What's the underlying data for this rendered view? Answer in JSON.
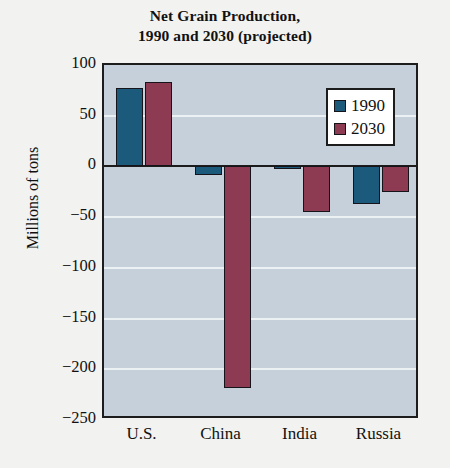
{
  "chart_data": {
    "type": "bar",
    "title": "Net Grain Production, 1990 and 2030 (projected)",
    "title_line1": "Net Grain Production,",
    "title_line2": "1990 and 2030 (projected)",
    "xlabel": "",
    "ylabel": "Millions of tons",
    "categories": [
      "U.S.",
      "China",
      "India",
      "Russia"
    ],
    "series": [
      {
        "name": "1990",
        "color": "#1b5a7b",
        "values": [
          77,
          -8,
          -2,
          -37
        ]
      },
      {
        "name": "2030",
        "color": "#8d3a53",
        "values": [
          83,
          -218,
          -45,
          -25
        ]
      }
    ],
    "ylim": [
      -250,
      100
    ],
    "yticks": [
      100,
      50,
      0,
      -50,
      -100,
      -150,
      -200,
      -250
    ],
    "ytick_labels": [
      "100",
      "50",
      "0",
      "−50",
      "−100",
      "−150",
      "−200",
      "−250"
    ],
    "grid": true,
    "legend_position": "upper-right",
    "plot_background": "#c6d0da",
    "figure_background": "#f2f2f0"
  },
  "legend": {
    "entries": [
      {
        "label": "1990"
      },
      {
        "label": "2030"
      }
    ]
  }
}
